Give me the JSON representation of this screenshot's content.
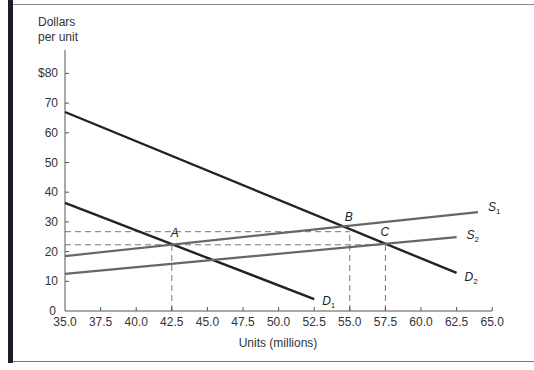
{
  "chart_data": {
    "type": "line",
    "title": "",
    "ylabel": "Dollars per unit",
    "ylabel_lines": [
      "Dollars",
      "per unit"
    ],
    "xlabel": "Units (millions)",
    "xlim": [
      35.0,
      65.0
    ],
    "ylim": [
      0,
      85
    ],
    "grid": false,
    "x_ticks": [
      "35.0",
      "37.5",
      "40.0",
      "42.5",
      "45.0",
      "47.5",
      "50.0",
      "52.5",
      "55.0",
      "57.5",
      "60.0",
      "62.5",
      "65.0"
    ],
    "y_ticks": [
      "0",
      "10",
      "20",
      "30",
      "40",
      "50",
      "60",
      "70",
      "$80"
    ],
    "series": [
      {
        "name": "D1",
        "label": "D",
        "sub": "1",
        "style": "solid",
        "color": "#222222",
        "points": [
          [
            35.0,
            36.4
          ],
          [
            52.5,
            4.0
          ]
        ]
      },
      {
        "name": "D2",
        "label": "D",
        "sub": "2",
        "style": "solid",
        "color": "#222222",
        "points": [
          [
            35.0,
            67.0
          ],
          [
            62.5,
            12.8
          ]
        ]
      },
      {
        "name": "S1",
        "label": "S",
        "sub": "1",
        "style": "solid",
        "color": "#666666",
        "points": [
          [
            35.0,
            18.5
          ],
          [
            64.0,
            33.3
          ]
        ]
      },
      {
        "name": "S2",
        "label": "S",
        "sub": "2",
        "style": "solid",
        "color": "#666666",
        "points": [
          [
            35.0,
            12.5
          ],
          [
            62.5,
            24.9
          ]
        ]
      }
    ],
    "reference_lines": [
      {
        "orientation": "horizontal",
        "y": 26.7,
        "x_from": 35.0,
        "x_to": 55.0,
        "style": "dashed"
      },
      {
        "orientation": "horizontal",
        "y": 22.3,
        "x_from": 35.0,
        "x_to": 57.5,
        "style": "dashed"
      },
      {
        "orientation": "vertical",
        "x": 42.5,
        "y_from": 0,
        "y_to": 22.3,
        "style": "dashed"
      },
      {
        "orientation": "vertical",
        "x": 55.0,
        "y_from": 0,
        "y_to": 26.7,
        "style": "dashed"
      },
      {
        "orientation": "vertical",
        "x": 57.5,
        "y_from": 0,
        "y_to": 22.3,
        "style": "dashed"
      }
    ],
    "annotations": [
      {
        "text": "A",
        "x": 42.5,
        "y": 22.3
      },
      {
        "text": "B",
        "x": 55.0,
        "y": 27.3
      },
      {
        "text": "C",
        "x": 57.5,
        "y": 22.5
      }
    ]
  }
}
